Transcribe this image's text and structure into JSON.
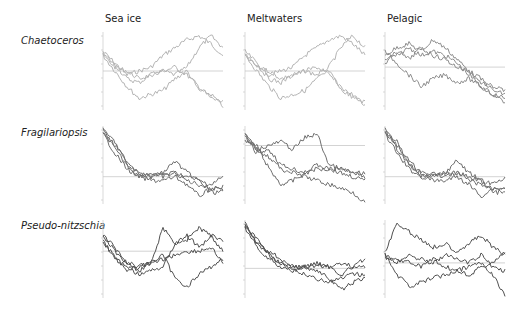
{
  "chart_data": {
    "type": "line",
    "title": "",
    "layout": "3x3 small-multiples grid; rows = diatom genus, columns = habitat",
    "columns": [
      "Sea ice",
      "Meltwaters",
      "Pelagic"
    ],
    "rows": [
      "Chaetoceros",
      "Fragilariopsis",
      "Pseudo-nitzschia"
    ],
    "grid": false,
    "legend": null,
    "xlabel": "",
    "ylabel": "",
    "panels": [
      {
        "row": "Chaetoceros",
        "column": "Sea ice",
        "color": "#b4b4b4",
        "zero_line": 0.5,
        "series": [
          {
            "name": "trajectory 1",
            "values": [
              0.25,
              0.4,
              0.55,
              0.5,
              0.45,
              0.3,
              0.2,
              0.1,
              0.05,
              0.15,
              0.3
            ]
          },
          {
            "name": "trajectory 2",
            "values": [
              0.3,
              0.45,
              0.5,
              0.6,
              0.55,
              0.5,
              0.55,
              0.45,
              0.2,
              0.05,
              0.2
            ]
          },
          {
            "name": "trajectory 3",
            "values": [
              0.3,
              0.5,
              0.7,
              0.85,
              0.8,
              0.75,
              0.6,
              0.5,
              0.75,
              0.8,
              0.95
            ]
          },
          {
            "name": "trajectory 4",
            "values": [
              0.28,
              0.42,
              0.6,
              0.65,
              0.55,
              0.5,
              0.45,
              0.55,
              0.7,
              0.85,
              0.9
            ]
          }
        ]
      },
      {
        "row": "Chaetoceros",
        "column": "Meltwaters",
        "color": "#b4b4b4",
        "zero_line": 0.5,
        "series": [
          {
            "name": "trajectory 1",
            "values": [
              0.25,
              0.4,
              0.55,
              0.5,
              0.45,
              0.3,
              0.2,
              0.1,
              0.05,
              0.15,
              0.3
            ]
          },
          {
            "name": "trajectory 2",
            "values": [
              0.3,
              0.45,
              0.5,
              0.6,
              0.55,
              0.5,
              0.55,
              0.45,
              0.2,
              0.05,
              0.2
            ]
          },
          {
            "name": "trajectory 3",
            "values": [
              0.3,
              0.5,
              0.7,
              0.85,
              0.8,
              0.75,
              0.6,
              0.5,
              0.75,
              0.8,
              0.95
            ]
          },
          {
            "name": "trajectory 4",
            "values": [
              0.28,
              0.42,
              0.6,
              0.65,
              0.55,
              0.5,
              0.45,
              0.55,
              0.7,
              0.85,
              0.9
            ]
          }
        ]
      },
      {
        "row": "Chaetoceros",
        "column": "Pelagic",
        "color": "#8c8c8c",
        "zero_line": 0.45,
        "series": [
          {
            "name": "trajectory 1",
            "values": [
              0.3,
              0.2,
              0.15,
              0.25,
              0.1,
              0.2,
              0.35,
              0.5,
              0.6,
              0.75,
              0.8
            ]
          },
          {
            "name": "trajectory 2",
            "values": [
              0.35,
              0.3,
              0.2,
              0.3,
              0.25,
              0.3,
              0.4,
              0.55,
              0.7,
              0.8,
              0.9
            ]
          },
          {
            "name": "trajectory 3",
            "values": [
              0.25,
              0.4,
              0.55,
              0.7,
              0.6,
              0.55,
              0.65,
              0.6,
              0.7,
              0.8,
              0.85
            ]
          },
          {
            "name": "trajectory 4",
            "values": [
              0.4,
              0.25,
              0.35,
              0.2,
              0.3,
              0.35,
              0.45,
              0.5,
              0.65,
              0.7,
              0.75
            ]
          }
        ]
      },
      {
        "row": "Fragilariopsis",
        "column": "Sea ice",
        "color": "#6e6e6e",
        "zero_line": 0.65,
        "series": [
          {
            "name": "trajectory 1",
            "values": [
              0.05,
              0.3,
              0.5,
              0.65,
              0.6,
              0.65,
              0.6,
              0.7,
              0.75,
              0.8,
              0.78
            ]
          },
          {
            "name": "trajectory 2",
            "values": [
              0.08,
              0.25,
              0.45,
              0.6,
              0.65,
              0.6,
              0.45,
              0.6,
              0.7,
              0.85,
              0.85
            ]
          },
          {
            "name": "trajectory 3",
            "values": [
              0.1,
              0.35,
              0.55,
              0.65,
              0.7,
              0.7,
              0.65,
              0.75,
              0.9,
              0.8,
              0.8
            ]
          },
          {
            "name": "trajectory 4",
            "values": [
              0.06,
              0.2,
              0.5,
              0.6,
              0.65,
              0.62,
              0.6,
              0.65,
              0.7,
              0.75,
              0.65
            ]
          }
        ]
      },
      {
        "row": "Fragilariopsis",
        "column": "Meltwaters",
        "color": "#6e6e6e",
        "zero_line": 0.25,
        "series": [
          {
            "name": "trajectory 1",
            "values": [
              0.1,
              0.3,
              0.25,
              0.2,
              0.3,
              0.15,
              0.1,
              0.5,
              0.55,
              0.6,
              0.65
            ]
          },
          {
            "name": "trajectory 2",
            "values": [
              0.15,
              0.35,
              0.3,
              0.5,
              0.55,
              0.6,
              0.5,
              0.55,
              0.55,
              0.6,
              0.6
            ]
          },
          {
            "name": "trajectory 3",
            "values": [
              0.2,
              0.25,
              0.55,
              0.75,
              0.7,
              0.6,
              0.55,
              0.55,
              0.6,
              0.65,
              0.7
            ]
          },
          {
            "name": "trajectory 4",
            "values": [
              0.12,
              0.3,
              0.4,
              0.55,
              0.6,
              0.65,
              0.7,
              0.75,
              0.8,
              0.85,
              0.98
            ]
          }
        ]
      },
      {
        "row": "Fragilariopsis",
        "column": "Pelagic",
        "color": "#6e6e6e",
        "zero_line": 0.65,
        "series": [
          {
            "name": "trajectory 1",
            "values": [
              0.05,
              0.3,
              0.5,
              0.65,
              0.6,
              0.65,
              0.6,
              0.7,
              0.75,
              0.8,
              0.78
            ]
          },
          {
            "name": "trajectory 2",
            "values": [
              0.08,
              0.25,
              0.45,
              0.6,
              0.65,
              0.6,
              0.45,
              0.6,
              0.7,
              0.85,
              0.85
            ]
          },
          {
            "name": "trajectory 3",
            "values": [
              0.1,
              0.35,
              0.55,
              0.65,
              0.7,
              0.7,
              0.65,
              0.75,
              0.9,
              0.8,
              0.8
            ]
          },
          {
            "name": "trajectory 4",
            "values": [
              0.06,
              0.2,
              0.5,
              0.6,
              0.65,
              0.62,
              0.6,
              0.65,
              0.7,
              0.75,
              0.65
            ]
          }
        ]
      },
      {
        "row": "Pseudo-nitzschia",
        "column": "Sea ice",
        "color": "#505050",
        "zero_line": 0.4,
        "series": [
          {
            "name": "trajectory 1",
            "values": [
              0.2,
              0.35,
              0.55,
              0.6,
              0.55,
              0.1,
              0.3,
              0.2,
              0.35,
              0.2,
              0.4
            ]
          },
          {
            "name": "trajectory 2",
            "values": [
              0.25,
              0.5,
              0.6,
              0.7,
              0.65,
              0.6,
              0.3,
              0.25,
              0.1,
              0.2,
              0.25
            ]
          },
          {
            "name": "trajectory 3",
            "values": [
              0.3,
              0.45,
              0.65,
              0.6,
              0.55,
              0.45,
              0.75,
              0.85,
              0.7,
              0.6,
              0.5
            ]
          },
          {
            "name": "trajectory 4",
            "values": [
              0.2,
              0.4,
              0.55,
              0.65,
              0.55,
              0.5,
              0.45,
              0.4,
              0.4,
              0.35,
              0.55
            ]
          }
        ]
      },
      {
        "row": "Pseudo-nitzschia",
        "column": "Meltwaters",
        "color": "#505050",
        "zero_line": 0.62,
        "series": [
          {
            "name": "trajectory 1",
            "values": [
              0.05,
              0.3,
              0.4,
              0.5,
              0.6,
              0.6,
              0.55,
              0.6,
              0.7,
              0.6,
              0.5
            ]
          },
          {
            "name": "trajectory 2",
            "values": [
              0.08,
              0.25,
              0.45,
              0.55,
              0.65,
              0.7,
              0.75,
              0.8,
              0.75,
              0.7,
              0.7
            ]
          },
          {
            "name": "trajectory 3",
            "values": [
              0.1,
              0.35,
              0.5,
              0.6,
              0.65,
              0.6,
              0.65,
              0.75,
              0.9,
              0.8,
              0.75
            ]
          },
          {
            "name": "trajectory 4",
            "values": [
              0.06,
              0.3,
              0.45,
              0.55,
              0.6,
              0.62,
              0.58,
              0.6,
              0.55,
              0.6,
              0.6
            ]
          }
        ]
      },
      {
        "row": "Pseudo-nitzschia",
        "column": "Pelagic",
        "color": "#505050",
        "zero_line": 0.55,
        "series": [
          {
            "name": "trajectory 1",
            "values": [
              0.4,
              0.05,
              0.15,
              0.25,
              0.35,
              0.3,
              0.4,
              0.3,
              0.2,
              0.35,
              0.45
            ]
          },
          {
            "name": "trajectory 2",
            "values": [
              0.45,
              0.55,
              0.45,
              0.5,
              0.55,
              0.45,
              0.5,
              0.55,
              0.45,
              0.6,
              0.65
            ]
          },
          {
            "name": "trajectory 3",
            "values": [
              0.5,
              0.5,
              0.55,
              0.6,
              0.5,
              0.6,
              0.65,
              0.6,
              0.55,
              0.7,
              0.98
            ]
          },
          {
            "name": "trajectory 4",
            "values": [
              0.45,
              0.7,
              0.85,
              0.8,
              0.75,
              0.7,
              0.65,
              0.7,
              0.6,
              0.55,
              0.4
            ]
          }
        ]
      }
    ]
  },
  "headers": {
    "col0": "Sea ice",
    "col1": "Meltwaters",
    "col2": "Pelagic",
    "row0": "Chaetoceros",
    "row1": "Fragilariopsis",
    "row2": "Pseudo-nitzschia"
  }
}
